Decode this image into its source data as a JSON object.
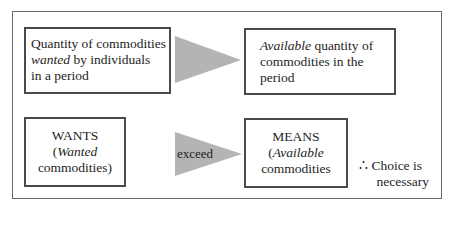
{
  "diagram": {
    "top_row": {
      "left_box": {
        "line1": "Quantity of commodities",
        "line2_italic": "wanted",
        "line2_rest": " by individuals",
        "line3": "in a period"
      },
      "arrow_label": "",
      "right_box": {
        "line1_italic": "Available",
        "line1_rest": " quantity of",
        "line2": "commodities in the",
        "line3": "period"
      }
    },
    "bottom_row": {
      "left_box": {
        "line1": "WANTS",
        "line2_prefix": "(",
        "line2_italic": "Wanted",
        "line3": "commodities)"
      },
      "arrow_label": "exceed",
      "right_box": {
        "line1": "MEANS",
        "line2_prefix": "(",
        "line2_italic": "Available",
        "line3": "commodities"
      },
      "conclusion": {
        "line1": "∴ Choice is",
        "line2": "necessary"
      }
    },
    "colors": {
      "arrow_fill": "#b4b4b4",
      "box_border": "#4a4a4a",
      "frame_border": "#6a6a6a"
    }
  }
}
